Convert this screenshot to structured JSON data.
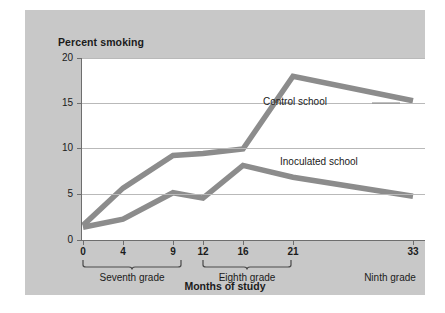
{
  "panel": {
    "background": "#c8c8c8"
  },
  "chart_data": {
    "type": "line",
    "title": "Percent smoking",
    "xlabel": "Months of study",
    "ylabel": "Percent smoking",
    "x": [
      0,
      4,
      9,
      12,
      16,
      21,
      33
    ],
    "xtick_labels": [
      "0",
      "4",
      "9",
      "12",
      "16",
      "21",
      "33"
    ],
    "ytick_labels": [
      "0",
      "5",
      "10",
      "15",
      "20"
    ],
    "yticks": [
      0,
      5,
      10,
      15,
      20
    ],
    "ylim": [
      0,
      20
    ],
    "xlim": [
      0,
      35
    ],
    "grid": "horizontal",
    "legend_position": "inline-annotations",
    "line_color": "#8c8c8c",
    "series": [
      {
        "name": "Control school",
        "values": [
          1.6,
          5.7,
          9.3,
          9.5,
          10.0,
          18.0,
          15.3
        ],
        "label_x": 263,
        "label_y": 90
      },
      {
        "name": "Inoculated school",
        "values": [
          1.4,
          2.3,
          5.2,
          4.6,
          8.2,
          6.9,
          4.8
        ],
        "label_x": 280,
        "label_y": 150
      }
    ],
    "annotations": [
      {
        "text": "Seventh grade",
        "span": [
          "0",
          "9"
        ]
      },
      {
        "text": "Eighth grade",
        "span": [
          "12",
          "21"
        ]
      },
      {
        "text": "Ninth grade",
        "span": [
          "33",
          "33"
        ]
      }
    ]
  },
  "axis": {
    "title": "Months of study"
  },
  "groups": [
    {
      "label": "Seventh grade",
      "left": 57,
      "right": 157,
      "center": 107
    },
    {
      "label": "Eighth grade",
      "left": 172,
      "right": 272,
      "center": 222
    },
    {
      "label": "Ninth grade",
      "center": 365
    }
  ]
}
